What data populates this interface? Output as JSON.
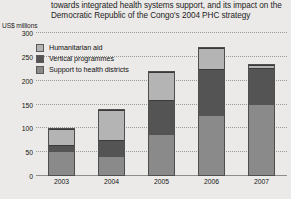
{
  "title": {
    "line1": "towards integrated health systems support, and its impact on the",
    "line2": "Democratic Republic of the Congo's 2004 PHC strategy"
  },
  "axis_unit": "US$ millions",
  "legend": {
    "items": [
      {
        "label": "Humanitarian aid",
        "color": "#b4b4b4",
        "key": "humanitarian-aid"
      },
      {
        "label": "Vertical programmes",
        "color": "#545454",
        "key": "vertical-programmes"
      },
      {
        "label": "Support to health districts",
        "color": "#8a8a8a",
        "key": "support-to-health-districts"
      }
    ]
  },
  "chart_data": {
    "type": "bar",
    "stacked": true,
    "title": "towards integrated health systems support, and its impact on the Democratic Republic of the Congo's 2004 PHC strategy",
    "xlabel": "",
    "ylabel": "US$ millions",
    "ylim": [
      0,
      300
    ],
    "yticks": [
      0,
      50,
      100,
      150,
      200,
      250,
      300
    ],
    "ytick_labels": [
      "0",
      "50",
      "100",
      "150",
      "200",
      "250",
      "300"
    ],
    "grid": true,
    "legend_position": "upper-left-inside",
    "categories": [
      "2003",
      "2004",
      "2005",
      "2006",
      "2007"
    ],
    "series": [
      {
        "name": "Support to health districts",
        "color": "#8a8a8a",
        "values": [
          50,
          40,
          85,
          125,
          150
        ]
      },
      {
        "name": "Vertical programmes",
        "color": "#545454",
        "values": [
          15,
          35,
          75,
          100,
          78
        ]
      },
      {
        "name": "Humanitarian aid",
        "color": "#b4b4b4",
        "values": [
          35,
          65,
          60,
          45,
          7
        ]
      }
    ],
    "totals": [
      100,
      140,
      220,
      270,
      235
    ]
  }
}
